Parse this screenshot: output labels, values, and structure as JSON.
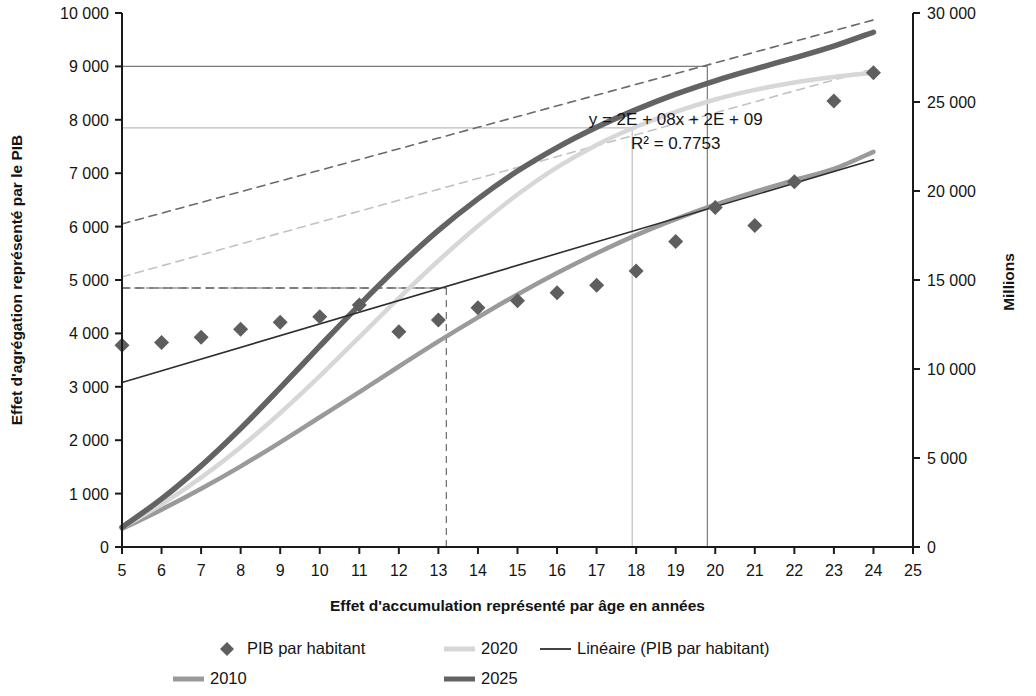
{
  "chart_data": {
    "type": "scatter",
    "title": "",
    "xlabel": "Effet d'accumulation représenté par âge en années",
    "ylabel": "Effet d'agrégation représenté par le PIB",
    "y2label": "Millions",
    "xlim": [
      5,
      25
    ],
    "ylim": [
      0,
      10000
    ],
    "y2lim": [
      0,
      30000
    ],
    "xticks": [
      "5",
      "6",
      "7",
      "8",
      "9",
      "10",
      "11",
      "12",
      "13",
      "14",
      "15",
      "16",
      "17",
      "18",
      "19",
      "20",
      "21",
      "22",
      "23",
      "24",
      "25"
    ],
    "xtick_values": [
      5,
      6,
      7,
      8,
      9,
      10,
      11,
      12,
      13,
      14,
      15,
      16,
      17,
      18,
      19,
      20,
      21,
      22,
      23,
      24,
      25
    ],
    "yticks": [
      "0",
      "1 000",
      "2 000",
      "3 000",
      "4 000",
      "5 000",
      "6 000",
      "7 000",
      "8 000",
      "9 000",
      "10 000"
    ],
    "ytick_values": [
      0,
      1000,
      2000,
      3000,
      4000,
      5000,
      6000,
      7000,
      8000,
      9000,
      10000
    ],
    "y2ticks": [
      "0",
      "5 000",
      "10 000",
      "15 000",
      "20 000",
      "25 000",
      "30 000"
    ],
    "y2tick_values": [
      0,
      5000,
      10000,
      15000,
      20000,
      25000,
      30000
    ],
    "grid": false,
    "legend_position": "bottom",
    "annotations": [
      {
        "name": "equation",
        "text": "y = 2E + 08x + 2E + 09",
        "x": 19.0,
        "y": 7900
      },
      {
        "name": "r-squared",
        "text": "R² = 0.7753",
        "x": 19.0,
        "y": 7450
      }
    ],
    "series": [
      {
        "name": "PIB par habitant",
        "type": "scatter",
        "marker": "diamond",
        "color": "#5e5e5e",
        "x": [
          5,
          6,
          7,
          8,
          9,
          10,
          11,
          12,
          13,
          14,
          15,
          16,
          17,
          18,
          19,
          20,
          21,
          22,
          23,
          24
        ],
        "values": [
          3780,
          3830,
          3930,
          4080,
          4210,
          4310,
          4530,
          4030,
          4250,
          4480,
          4610,
          4760,
          4900,
          5170,
          5720,
          6360,
          6020,
          6840,
          8350,
          8880
        ]
      },
      {
        "name": "2010",
        "type": "line",
        "color": "#9a9a9a",
        "width": 4.5,
        "x": [
          5,
          6,
          7,
          8,
          9,
          10,
          11,
          12,
          13,
          14,
          15,
          16,
          17,
          18,
          19,
          20,
          21,
          22,
          23,
          24
        ],
        "values": [
          340,
          700,
          1090,
          1510,
          1960,
          2430,
          2900,
          3380,
          3850,
          4300,
          4730,
          5130,
          5500,
          5840,
          6140,
          6410,
          6650,
          6870,
          7080,
          7400
        ]
      },
      {
        "name": "2020",
        "type": "line",
        "color": "#d7d7d7",
        "width": 4.5,
        "x": [
          5,
          6,
          7,
          8,
          9,
          10,
          11,
          12,
          13,
          14,
          15,
          16,
          17,
          18,
          19,
          20,
          21,
          22,
          23,
          24
        ],
        "values": [
          360,
          800,
          1300,
          1870,
          2510,
          3200,
          3930,
          4660,
          5360,
          6010,
          6600,
          7110,
          7530,
          7870,
          8150,
          8380,
          8560,
          8700,
          8800,
          8880
        ]
      },
      {
        "name": "2025",
        "type": "line",
        "color": "#636363",
        "width": 5.5,
        "x": [
          5,
          6,
          7,
          8,
          9,
          10,
          11,
          12,
          13,
          14,
          15,
          16,
          17,
          18,
          19,
          20,
          21,
          22,
          23,
          24
        ],
        "values": [
          370,
          900,
          1520,
          2220,
          2980,
          3760,
          4530,
          5260,
          5930,
          6520,
          7040,
          7480,
          7860,
          8190,
          8480,
          8730,
          8950,
          9160,
          9380,
          9640
        ]
      },
      {
        "name": "Linéaire (PIB par habitant)",
        "type": "line",
        "color": "#2e2e2e",
        "width": 1.6,
        "x": [
          5,
          24
        ],
        "values": [
          3080,
          7250
        ]
      }
    ],
    "trend_dashed": [
      {
        "name": "dashed-upper",
        "color": "#6a6a6a",
        "x": [
          5,
          24
        ],
        "values": [
          6050,
          9870
        ]
      },
      {
        "name": "dashed-lower",
        "color": "#c2c2c2",
        "x": [
          5,
          24
        ],
        "values": [
          5060,
          8950
        ]
      },
      {
        "name": "dashed-horizontal",
        "color": "#6a6a6a",
        "x": [
          5,
          13.2
        ],
        "values": [
          4850,
          4850
        ]
      }
    ],
    "reference_lines": [
      {
        "name": "ref-dashed",
        "style": "dashed",
        "color": "#6a6a6a",
        "x": 13.2,
        "y": 4850
      },
      {
        "name": "ref-light",
        "style": "solid",
        "color": "#bdbdbd",
        "x": 17.9,
        "y": 7850
      },
      {
        "name": "ref-dark",
        "style": "solid",
        "color": "#7a7a7a",
        "x": 19.8,
        "y": 9000
      }
    ],
    "legend": [
      {
        "label": "PIB par habitant",
        "marker": "diamond",
        "color": "#5e5e5e"
      },
      {
        "label": "2020",
        "marker": "line",
        "color": "#d7d7d7"
      },
      {
        "label": "Linéaire (PIB par habitant)",
        "marker": "thinline",
        "color": "#2e2e2e"
      },
      {
        "label": "2010",
        "marker": "line",
        "color": "#9a9a9a"
      },
      {
        "label": "2025",
        "marker": "line",
        "color": "#636363"
      }
    ]
  }
}
